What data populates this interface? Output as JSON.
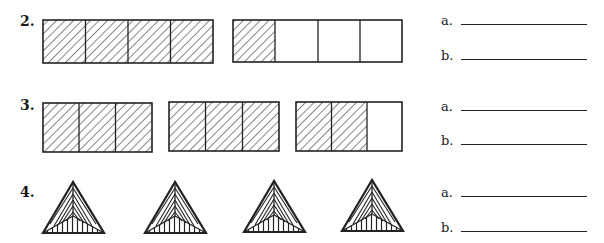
{
  "problems": [
    {
      "number": "2.",
      "figures": [
        {
          "type": "rectangle",
          "parts": 4,
          "shaded": 4
        },
        {
          "type": "rectangle",
          "parts": 4,
          "shaded": 1
        }
      ],
      "answers": [
        {
          "label": "a.",
          "value": ""
        },
        {
          "label": "b.",
          "value": ""
        }
      ]
    },
    {
      "number": "3.",
      "figures": [
        {
          "type": "rectangle",
          "parts": 3,
          "shaded": 3
        },
        {
          "type": "rectangle",
          "parts": 3,
          "shaded": 3
        },
        {
          "type": "rectangle",
          "parts": 3,
          "shaded": 2
        }
      ],
      "answers": [
        {
          "label": "a.",
          "value": ""
        },
        {
          "label": "b.",
          "value": ""
        }
      ]
    },
    {
      "number": "4.",
      "figures": [
        {
          "type": "triangle",
          "parts": 3,
          "shaded": 3
        },
        {
          "type": "triangle",
          "parts": 3,
          "shaded": 3
        },
        {
          "type": "triangle",
          "parts": 3,
          "shaded": 3
        },
        {
          "type": "triangle",
          "parts": 3,
          "shaded": 3
        }
      ],
      "answers": [
        {
          "label": "a.",
          "value": ""
        },
        {
          "label": "b.",
          "value": ""
        }
      ]
    }
  ]
}
